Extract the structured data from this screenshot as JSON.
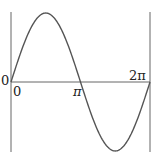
{
  "chart_data": {
    "type": "line",
    "title": "",
    "xlabel": "",
    "ylabel": "",
    "function": "sin(x)",
    "x_ticks": [
      "0",
      "π",
      "2π"
    ],
    "y_ticks": [
      "0"
    ],
    "xlim": [
      0,
      6.283
    ],
    "ylim": [
      -1,
      1
    ],
    "grid": false,
    "series": [
      {
        "name": "sin x",
        "x": [
          0,
          0.785,
          1.571,
          2.356,
          3.142,
          3.927,
          4.712,
          5.498,
          6.283
        ],
        "values": [
          0,
          0.707,
          1,
          0.707,
          0,
          -0.707,
          -1,
          -0.707,
          0
        ]
      }
    ],
    "colors": {
      "curve": "#555555",
      "axes": "#555555"
    }
  },
  "labels": {
    "y_zero": "0",
    "x_zero": "0",
    "x_pi": "π",
    "x_2pi": "2π"
  }
}
